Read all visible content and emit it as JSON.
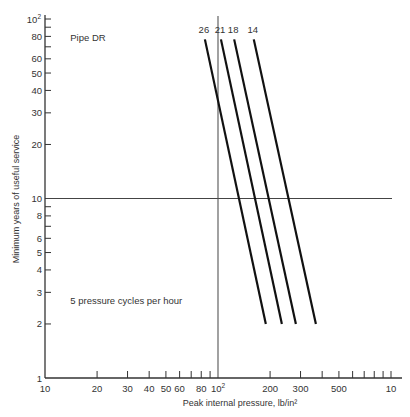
{
  "chart_data": {
    "type": "line",
    "title": "",
    "xlabel": "Peak internal pressure, lb/in²",
    "ylabel": "Minimum years of useful service",
    "xscale": "log",
    "yscale": "log",
    "xlim": [
      10,
      1000
    ],
    "ylim": [
      1,
      100
    ],
    "grid": false,
    "x_ticks": [
      {
        "value": 10,
        "label": "10"
      },
      {
        "value": 20,
        "label": "20"
      },
      {
        "value": 30,
        "label": "30"
      },
      {
        "value": 40,
        "label": "40"
      },
      {
        "value": 50,
        "label": "50"
      },
      {
        "value": 60,
        "label": "60"
      },
      {
        "value": 70,
        "label": ""
      },
      {
        "value": 80,
        "label": "80"
      },
      {
        "value": 90,
        "label": ""
      },
      {
        "value": 100,
        "label": "10²"
      },
      {
        "value": 200,
        "label": "200"
      },
      {
        "value": 300,
        "label": "300"
      },
      {
        "value": 400,
        "label": ""
      },
      {
        "value": 500,
        "label": "500"
      },
      {
        "value": 600,
        "label": ""
      },
      {
        "value": 700,
        "label": ""
      },
      {
        "value": 800,
        "label": ""
      },
      {
        "value": 900,
        "label": ""
      },
      {
        "value": 1000,
        "label": "10"
      }
    ],
    "y_ticks": [
      {
        "value": 1,
        "label": "1"
      },
      {
        "value": 2,
        "label": "2"
      },
      {
        "value": 3,
        "label": "3"
      },
      {
        "value": 4,
        "label": "4"
      },
      {
        "value": 5,
        "label": "5"
      },
      {
        "value": 6,
        "label": "6"
      },
      {
        "value": 7,
        "label": ""
      },
      {
        "value": 8,
        "label": "8"
      },
      {
        "value": 9,
        "label": ""
      },
      {
        "value": 10,
        "label": "10"
      },
      {
        "value": 20,
        "label": "20"
      },
      {
        "value": 30,
        "label": "30"
      },
      {
        "value": 40,
        "label": "40"
      },
      {
        "value": 50,
        "label": "50"
      },
      {
        "value": 60,
        "label": "60"
      },
      {
        "value": 70,
        "label": ""
      },
      {
        "value": 80,
        "label": "80"
      },
      {
        "value": 90,
        "label": ""
      },
      {
        "value": 100,
        "label": "10²"
      }
    ],
    "series": [
      {
        "name": "26",
        "points": [
          {
            "x": 84,
            "y": 77
          },
          {
            "x": 189,
            "y": 2
          }
        ]
      },
      {
        "name": "21",
        "points": [
          {
            "x": 104,
            "y": 77
          },
          {
            "x": 234,
            "y": 2
          }
        ]
      },
      {
        "name": "18",
        "points": [
          {
            "x": 124,
            "y": 77
          },
          {
            "x": 282,
            "y": 2
          }
        ]
      },
      {
        "name": "14",
        "points": [
          {
            "x": 161,
            "y": 77
          },
          {
            "x": 368,
            "y": 2
          }
        ]
      }
    ],
    "reference_lines": [
      {
        "orientation": "horizontal",
        "value": 10,
        "x_range": [
          10,
          1000
        ]
      },
      {
        "orientation": "vertical",
        "value": 100,
        "y_range": [
          1,
          100
        ]
      }
    ],
    "annotations": [
      {
        "text": "Pipe DR",
        "x": 14,
        "y": 75
      },
      {
        "text": "5 pressure cycles per hour",
        "x": 14,
        "y": 2.6
      }
    ]
  }
}
